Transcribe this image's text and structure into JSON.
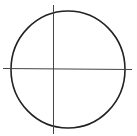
{
  "diagram": {
    "stroke_color": "#222222",
    "axis_color": "#444444",
    "background": "#ffffff",
    "circle": {
      "cx": 68,
      "cy": 69.5,
      "rx": 57,
      "ry": 58.5
    },
    "horizontal_line": {
      "x1": 3,
      "y1": 68.5,
      "x2": 132,
      "y2": 69.5
    },
    "vertical_line": {
      "x1": 53.5,
      "y1": 5,
      "x2": 53.5,
      "y2": 134
    }
  }
}
